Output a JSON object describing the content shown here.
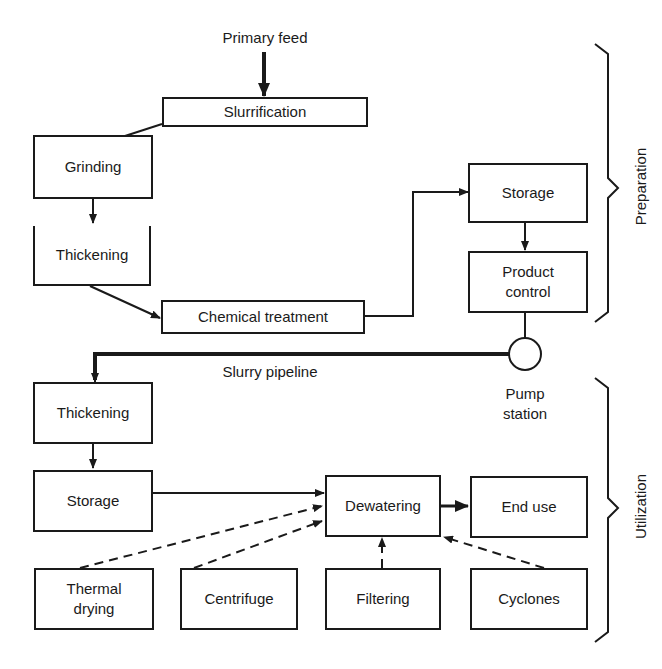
{
  "diagram": {
    "sections": {
      "preparation": "Preparation",
      "utilization": "Utilization"
    },
    "labels": {
      "primary_feed": "Primary feed",
      "slurry_pipeline": "Slurry pipeline",
      "pump_station_line1": "Pump",
      "pump_station_line2": "station"
    },
    "preparation_nodes": {
      "slurrification": "Slurrification",
      "grinding": "Grinding",
      "thickening": "Thickening",
      "chemical_treatment": "Chemical treatment",
      "storage": "Storage",
      "product_control_line1": "Product",
      "product_control_line2": "control"
    },
    "utilization_nodes": {
      "thickening": "Thickening",
      "storage": "Storage",
      "dewatering": "Dewatering",
      "end_use": "End use",
      "thermal_drying_line1": "Thermal",
      "thermal_drying_line2": "drying",
      "centrifuge": "Centrifuge",
      "filtering": "Filtering",
      "cyclones": "Cyclones"
    },
    "edges": [
      {
        "from": "Primary feed",
        "to": "Slurrification",
        "style": "solid-bold"
      },
      {
        "from": "Slurrification",
        "to": "Grinding",
        "style": "solid"
      },
      {
        "from": "Grinding",
        "to": "Thickening",
        "style": "solid"
      },
      {
        "from": "Thickening",
        "to": "Chemical treatment",
        "style": "solid"
      },
      {
        "from": "Chemical treatment",
        "to": "Storage",
        "style": "solid"
      },
      {
        "from": "Storage",
        "to": "Product control",
        "style": "solid"
      },
      {
        "from": "Product control",
        "to": "Pump station",
        "style": "solid"
      },
      {
        "from": "Pump station",
        "to": "Thickening (utilization)",
        "style": "bold",
        "label": "Slurry pipeline"
      },
      {
        "from": "Thickening (utilization)",
        "to": "Storage (utilization)",
        "style": "solid"
      },
      {
        "from": "Storage (utilization)",
        "to": "Dewatering",
        "style": "solid"
      },
      {
        "from": "Dewatering",
        "to": "End use",
        "style": "solid-bold"
      },
      {
        "from": "Thermal drying",
        "to": "Dewatering",
        "style": "dashed"
      },
      {
        "from": "Centrifuge",
        "to": "Dewatering",
        "style": "dashed"
      },
      {
        "from": "Filtering",
        "to": "Dewatering",
        "style": "dashed"
      },
      {
        "from": "Cyclones",
        "to": "Dewatering",
        "style": "dashed"
      }
    ]
  }
}
